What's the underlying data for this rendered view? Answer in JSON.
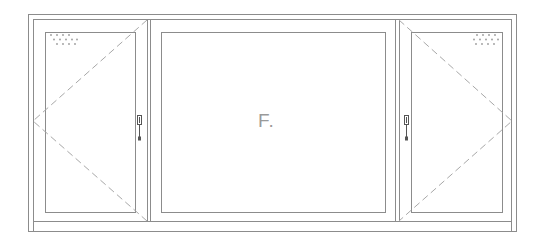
{
  "drawing": {
    "type": "window-elevation",
    "panes": [
      {
        "id": "left-sash",
        "kind": "casement",
        "hinge": "left",
        "handle_side": "right",
        "vent": true
      },
      {
        "id": "center-pane",
        "kind": "fixed",
        "label": "F."
      },
      {
        "id": "right-sash",
        "kind": "casement",
        "hinge": "right",
        "handle_side": "left",
        "vent": true
      }
    ],
    "colors": {
      "line": "#8c8c8c",
      "dash": "#a8a8a8",
      "handle": "#555555",
      "vent": "#9a9a9a"
    }
  },
  "center_label": "F."
}
